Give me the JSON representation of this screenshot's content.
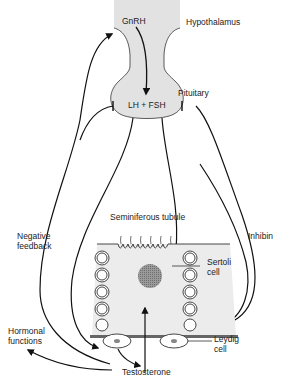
{
  "diagram": {
    "labels": {
      "gnrh": "GnRH",
      "hypothalamus": "Hypothalamus",
      "pituitary": "Pituitary",
      "lh_fsh": "LH + FSH",
      "seminiferous_tubule": "Seminiferous tubule",
      "sertoli_1": "Sertoli",
      "sertoli_2": "cell",
      "inhibin": "Inhibin",
      "negative_1": "Negative",
      "negative_2": "feedback",
      "hormonal_1": "Hormonal",
      "hormonal_2": "functions",
      "leydig_1": "Leydig",
      "leydig_2": "cell",
      "testosterone": "Testosterone"
    },
    "colors": {
      "fill_gray": "#e2e2e2",
      "line": "#111111",
      "nucleus": "#8a8a8a",
      "basement": "#666666"
    }
  }
}
